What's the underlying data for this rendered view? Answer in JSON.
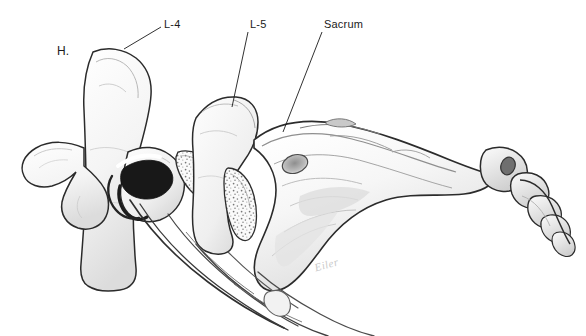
{
  "illustration": {
    "title": "Lumbosacral spine lateral view anatomical illustration",
    "medium": "pencil drawing",
    "background_color": "#ffffff",
    "ink_color": "#1a1a1a",
    "width": 586,
    "height": 336
  },
  "labels": {
    "h": "H.",
    "l4": "L-4",
    "l5": "L-5",
    "sacrum": "Sacrum"
  },
  "signature": {
    "text": "Eiler"
  },
  "leader_lines": [
    {
      "name": "l4",
      "x1": 161,
      "y1": 27,
      "x2": 124,
      "y2": 49
    },
    {
      "name": "l5",
      "x1": 248,
      "y1": 32,
      "x2": 232,
      "y2": 107
    },
    {
      "name": "sacrum",
      "x1": 322,
      "y1": 32,
      "x2": 283,
      "y2": 132
    }
  ],
  "structures": [
    {
      "name": "l4-vertebral-body",
      "label": "L-4 vertebra"
    },
    {
      "name": "l4-spinous-process",
      "label": "L-4 spinous process"
    },
    {
      "name": "l5-vertebral-body",
      "label": "L-5 vertebra"
    },
    {
      "name": "l4-l5-intervertebral-disc",
      "label": "L4-L5 disc"
    },
    {
      "name": "l5-s1-intervertebral-disc",
      "label": "L5-S1 disc"
    },
    {
      "name": "facet-joint-shadow",
      "label": "facet joint"
    },
    {
      "name": "sacrum-body",
      "label": "Sacrum"
    },
    {
      "name": "sacral-foramen",
      "label": "sacral foramen"
    },
    {
      "name": "coccyx-segments",
      "label": "Coccyx"
    },
    {
      "name": "nerve-roots",
      "label": "nerve roots"
    }
  ]
}
